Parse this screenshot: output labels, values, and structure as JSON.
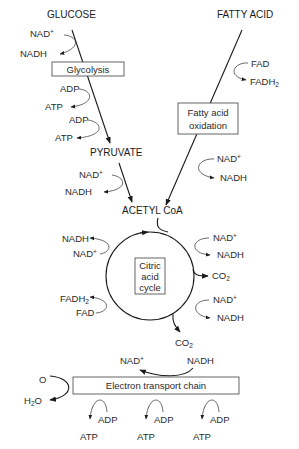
{
  "diagram": {
    "sources": {
      "glucose": "GLUCOSE",
      "fatty_acid": "FATTY ACID"
    },
    "glycolysis": {
      "box_label": "Glycolysis",
      "inputs": [
        {
          "in": "NAD+",
          "out": "NADH"
        },
        {
          "in": "ADP",
          "out": "ATP"
        },
        {
          "in": "ADP",
          "out": "ATP"
        }
      ],
      "product": "PYRUVATE",
      "pyruvate_step": {
        "in": "NAD+",
        "out": "NADH"
      }
    },
    "fatty_acid_oxidation": {
      "box_label_line1": "Fatty acid",
      "box_label_line2": "oxidation",
      "fad_step": {
        "in": "FAD",
        "out": "FADH2"
      },
      "nad_step": {
        "in": "NAD+",
        "out": "NADH"
      }
    },
    "acetyl_coa": "ACETYL CoA",
    "citric_acid_cycle": {
      "box_line1": "Citric",
      "box_line2": "acid",
      "box_line3": "cycle",
      "left_steps": [
        {
          "in": "NAD+",
          "out": "NADH"
        },
        {
          "in": "FAD",
          "out": "FADH2"
        }
      ],
      "right_steps": [
        {
          "in": "NAD+",
          "out": "NADH"
        },
        {
          "out": "CO2"
        },
        {
          "in": "NAD+",
          "out": "NADH"
        }
      ],
      "bottom_output": "CO2"
    },
    "electron_transport_chain": {
      "box_label": "Electron transport chain",
      "top_in": "NADH",
      "top_out": "NAD+",
      "oxygen_in": "O",
      "water_out": "H2O",
      "atp_steps": [
        {
          "in": "ADP",
          "out": "ATP"
        },
        {
          "in": "ADP",
          "out": "ATP"
        },
        {
          "in": "ADP",
          "out": "ATP"
        }
      ]
    }
  }
}
